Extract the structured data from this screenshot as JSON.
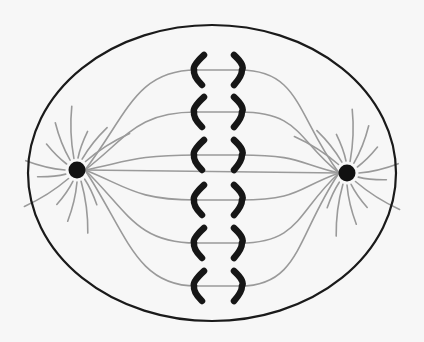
{
  "diagram": {
    "type": "metaphase-cell",
    "colors": {
      "background": "#f7f7f7",
      "membrane": "#1a1a1a",
      "spindle_fiber": "#9a9a9a",
      "centrosome": "#111111",
      "chromosome": "#161616"
    },
    "cell": {
      "cx": 212,
      "cy": 173,
      "rx": 184,
      "ry": 148
    },
    "poles": [
      {
        "name": "left-pole",
        "x": 77,
        "y": 170
      },
      {
        "name": "right-pole",
        "x": 347,
        "y": 173
      }
    ],
    "metaphase_plate": {
      "left_x": 196,
      "right_x": 240,
      "rows_y": [
        70,
        112,
        155,
        200,
        243,
        286
      ]
    }
  }
}
